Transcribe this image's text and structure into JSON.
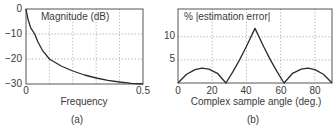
{
  "chart_data": [
    {
      "type": "line",
      "panel": "(a)",
      "title": "Magnitude (dB)",
      "xlabel": "Frequency",
      "ylabel": "",
      "xlim": [
        0,
        0.5
      ],
      "ylim": [
        -30,
        0
      ],
      "xticks": [
        "0",
        "0.5"
      ],
      "yticks": [
        "0",
        "−10",
        "−20",
        "−30"
      ],
      "grid": true,
      "series": [
        {
          "name": "Magnitude (dB)",
          "x": [
            0,
            0.005,
            0.01,
            0.02,
            0.037,
            0.05,
            0.07,
            0.1,
            0.15,
            0.2,
            0.25,
            0.3,
            0.35,
            0.4,
            0.45,
            0.5
          ],
          "y": [
            0,
            -2.5,
            -4.5,
            -7.5,
            -10,
            -13,
            -16.5,
            -20,
            -22.8,
            -24.8,
            -26.4,
            -27.6,
            -28.5,
            -29.2,
            -29.7,
            -30
          ]
        }
      ]
    },
    {
      "type": "line",
      "panel": "(b)",
      "title": "% |estimation error|",
      "xlabel": "Complex sample angle (deg.)",
      "ylabel": "",
      "xlim": [
        0,
        90
      ],
      "ylim": [
        0,
        16
      ],
      "xticks": [
        "0",
        "20",
        "40",
        "60",
        "80"
      ],
      "yticks": [
        "5",
        "10"
      ],
      "grid": true,
      "series": [
        {
          "name": "% |estimation error|",
          "x": [
            0,
            5,
            10,
            14,
            18,
            23,
            28,
            32,
            36,
            40,
            45,
            50,
            54,
            58,
            62,
            67,
            72,
            76,
            80,
            85,
            90
          ],
          "y": [
            0,
            1.9,
            2.9,
            3.2,
            3.0,
            2.1,
            0,
            2.4,
            5.0,
            7.9,
            11.8,
            7.9,
            5.0,
            2.4,
            0,
            2.1,
            3.0,
            3.2,
            2.9,
            1.9,
            0
          ]
        }
      ]
    }
  ],
  "panels": {
    "a": {
      "title": "Magnitude (dB)",
      "xlabel": "Frequency",
      "caption": "(a)",
      "yticks": [
        "0",
        "−10",
        "−20",
        "−30"
      ],
      "xticks": [
        "0",
        "0.5"
      ]
    },
    "b": {
      "title": "% |estimation error|",
      "xlabel": "Complex sample angle (deg.)",
      "caption": "(b)",
      "yticks": [
        "10",
        "5"
      ],
      "xticks": [
        "0",
        "20",
        "40",
        "60",
        "80"
      ]
    }
  },
  "colors": {
    "line": "#2b2b2b",
    "axes": "#555555",
    "grid": "#9a9a9a",
    "text": "#3a3a3a"
  }
}
